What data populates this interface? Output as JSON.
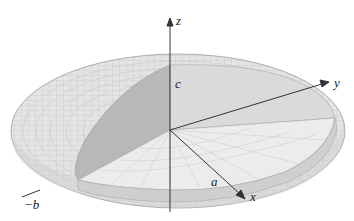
{
  "figure": {
    "axes": {
      "x_label": "x",
      "y_label": "y",
      "z_label": "z"
    },
    "intercepts": {
      "a_label": "a",
      "neg_b_label": "−b",
      "c_label": "c"
    },
    "colors": {
      "surface": "#e6e6e6",
      "grid": "#bdbdbd",
      "cut_face_dark": "#b9b9b9",
      "cut_face_light": "#dcdcdc",
      "axis": "#333333"
    }
  }
}
